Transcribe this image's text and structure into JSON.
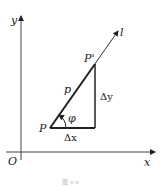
{
  "diagram": {
    "axes": {
      "x_label": "x",
      "y_label": "y",
      "origin_label": "O"
    },
    "line_label": "l",
    "points": {
      "P": "P",
      "P_prime": "P'"
    },
    "segment_label": "p",
    "angle_label": "φ",
    "delta_x": "Δx",
    "delta_y": "Δy",
    "caption": "图 x-x"
  }
}
